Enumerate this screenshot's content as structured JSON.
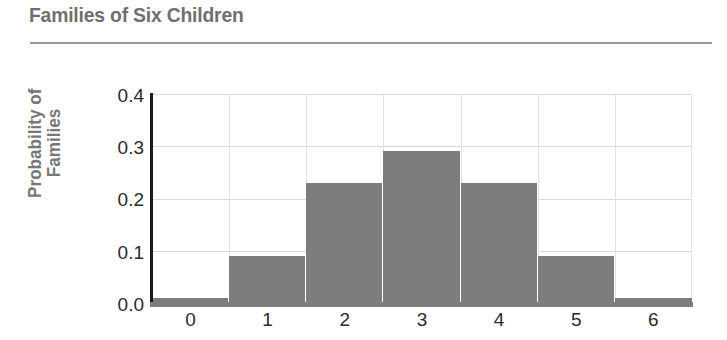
{
  "chart_data": {
    "type": "bar",
    "title": "Families of Six Children",
    "xlabel": "",
    "ylabel": "Probability of Families",
    "ylabel_lines": [
      "Probability of",
      "Families"
    ],
    "categories": [
      "0",
      "1",
      "2",
      "3",
      "4",
      "5",
      "6"
    ],
    "values": [
      0.01,
      0.09,
      0.23,
      0.29,
      0.23,
      0.09,
      0.01
    ],
    "ylim": [
      0.0,
      0.4
    ],
    "xlim": [
      -0.5,
      6.5
    ],
    "yticks": [
      "0.0",
      "0.1",
      "0.2",
      "0.3",
      "0.4"
    ],
    "ytick_values": [
      0.0,
      0.1,
      0.2,
      0.3,
      0.4
    ],
    "xticks": [
      "0",
      "1",
      "2",
      "3",
      "4",
      "5",
      "6"
    ],
    "grid": "both",
    "legend": "none",
    "bar_color": "#7d7d7d",
    "grid_color": "#d9d9d9",
    "axis_color": "#1a1a1a",
    "title_color": "#6f6f6f",
    "label_color": "#777777",
    "tick_color": "#2b2b2b"
  }
}
